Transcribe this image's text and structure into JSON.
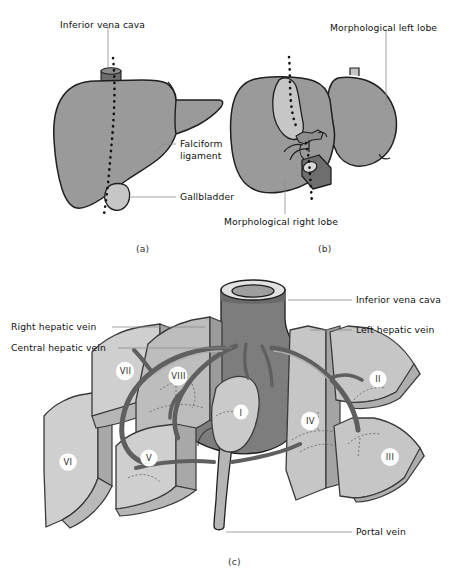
{
  "figure": {
    "panels": [
      {
        "id": "a",
        "letter": "(a)",
        "caption": "Anterior view of the liver"
      },
      {
        "id": "b",
        "letter": "(b)",
        "caption": "Posterior / inferior view of the liver"
      },
      {
        "id": "c",
        "letter": "(c)",
        "caption": "Exploded view of the functional liver segments"
      }
    ]
  },
  "panel_a": {
    "letter": "(a)",
    "labels": [
      {
        "name": "inferior-vena-cava",
        "text": "Inferior vena cava"
      },
      {
        "name": "falciform-ligament",
        "text": "Falciform\nligament",
        "line1": "Falciform",
        "line2": "ligament"
      },
      {
        "name": "gallbladder",
        "text": "Gallbladder"
      }
    ]
  },
  "panel_b": {
    "letter": "(b)",
    "labels": [
      {
        "name": "morphological-left-lobe",
        "text": "Morphological left lobe"
      },
      {
        "name": "morphological-right-lobe",
        "text": "Morphological right lobe"
      }
    ]
  },
  "panel_c": {
    "letter": "(c)",
    "labels": [
      {
        "name": "inferior-vena-cava",
        "text": "Inferior vena cava"
      },
      {
        "name": "right-hepatic-vein",
        "text": "Right hepatic vein"
      },
      {
        "name": "central-hepatic-vein",
        "text": "Central hepatic vein"
      },
      {
        "name": "left-hepatic-vein",
        "text": "Left hepatic vein"
      },
      {
        "name": "portal-vein",
        "text": "Portal vein"
      }
    ],
    "segments": [
      {
        "name": "segment-II",
        "text": "II"
      },
      {
        "name": "segment-III",
        "text": "III"
      },
      {
        "name": "segment-IV",
        "text": "IV"
      },
      {
        "name": "segment-V",
        "text": "V"
      },
      {
        "name": "segment-VI",
        "text": "VI"
      },
      {
        "name": "segment-VII",
        "text": "VII"
      },
      {
        "name": "segment-VIII",
        "text": "VIII"
      },
      {
        "name": "segment-I",
        "text": "I"
      }
    ]
  },
  "colors": {
    "background": "#ffffff",
    "liver_mid_gray": "#9a9a9a",
    "liver_light_gray": "#c9c9c9",
    "liver_pale_gray": "#d6d6d6",
    "vessel_dark_gray": "#6e6e6e",
    "vessel_mid_gray": "#8f8f8f",
    "outline": "#1f1f1f",
    "leader_line": "#8a8a8a",
    "text": "#111111"
  }
}
